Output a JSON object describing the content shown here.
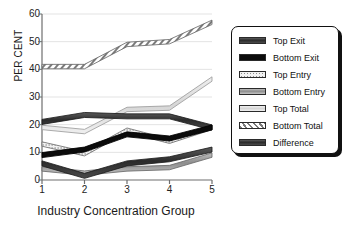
{
  "chart_data": {
    "type": "line",
    "title": "",
    "xlabel": "Industry Concentration Group",
    "ylabel": "PER CENT",
    "x": [
      1,
      2,
      3,
      4,
      5
    ],
    "xtick_labels": [
      "1",
      "2",
      "3",
      "4",
      "5"
    ],
    "ytick_labels": [
      "0",
      "10",
      "20",
      "30",
      "40",
      "50",
      "60"
    ],
    "ylim": [
      0,
      60
    ],
    "xlim": [
      1,
      5
    ],
    "grid": true,
    "legend_position": "right",
    "series": [
      {
        "name": "Top Exit",
        "values": [
          6,
          1.5,
          6,
          7.5,
          11
        ],
        "color": "#3b3b3b",
        "pattern": "solid-dark"
      },
      {
        "name": "Bottom Exit",
        "values": [
          9,
          11,
          16.5,
          15,
          19
        ],
        "color": "#0a0a0a",
        "pattern": "solid-black"
      },
      {
        "name": "Top Entry",
        "values": [
          13,
          9.5,
          18,
          14,
          19
        ],
        "color": "#e8e8e8",
        "pattern": "dotted-light"
      },
      {
        "name": "Bottom Entry",
        "values": [
          4,
          2.5,
          4,
          4.5,
          9
        ],
        "color": "#9a9a9a",
        "pattern": "gradient-gray"
      },
      {
        "name": "Top Total",
        "values": [
          19,
          17.5,
          25.5,
          26,
          36.5
        ],
        "color": "#d2d2d2",
        "pattern": "light-gray"
      },
      {
        "name": "Bottom Total",
        "values": [
          41,
          41,
          49,
          50,
          57
        ],
        "color": "#ffffff",
        "pattern": "diagonal-hatch"
      },
      {
        "name": "Difference",
        "values": [
          21,
          23.5,
          23,
          23,
          19
        ],
        "color": "#2e2e2e",
        "pattern": "solid-dark"
      }
    ]
  },
  "axes": {
    "ylabel": "PER CENT",
    "xlabel": "Industry Concentration Group",
    "yticks": [
      "0",
      "10",
      "20",
      "30",
      "40",
      "50",
      "60"
    ],
    "xticks": [
      "1",
      "2",
      "3",
      "4",
      "5"
    ]
  },
  "legend": {
    "items": [
      {
        "label": "Top Exit"
      },
      {
        "label": "Bottom Exit"
      },
      {
        "label": "Top Entry"
      },
      {
        "label": "Bottom Entry"
      },
      {
        "label": "Top Total"
      },
      {
        "label": "Bottom Total"
      },
      {
        "label": "Difference"
      }
    ]
  },
  "colors": {
    "axis": "#6e6e6e",
    "grid": "#e3e3e3",
    "text": "#1a1a1a",
    "legend_border": "#111111",
    "background": "#ffffff"
  }
}
